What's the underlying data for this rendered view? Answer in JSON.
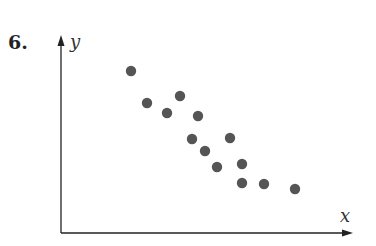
{
  "problem_number": "6.",
  "chart_data": {
    "type": "scatter",
    "title": "",
    "xlabel": "x",
    "ylabel": "y",
    "grid": false,
    "legend": null,
    "ticks": "none",
    "note": "No numeric scale shown; points given in pixel units relative to axis origin (x right, y up).",
    "points": [
      {
        "x": 70,
        "y": 162
      },
      {
        "x": 86,
        "y": 130
      },
      {
        "x": 106,
        "y": 120
      },
      {
        "x": 119,
        "y": 137
      },
      {
        "x": 137,
        "y": 117
      },
      {
        "x": 131,
        "y": 94
      },
      {
        "x": 169,
        "y": 95
      },
      {
        "x": 144,
        "y": 82
      },
      {
        "x": 156,
        "y": 66
      },
      {
        "x": 181,
        "y": 69
      },
      {
        "x": 181,
        "y": 50
      },
      {
        "x": 203,
        "y": 49
      },
      {
        "x": 234,
        "y": 44
      }
    ],
    "point_color": "#555555",
    "axis_color": "#222222"
  }
}
